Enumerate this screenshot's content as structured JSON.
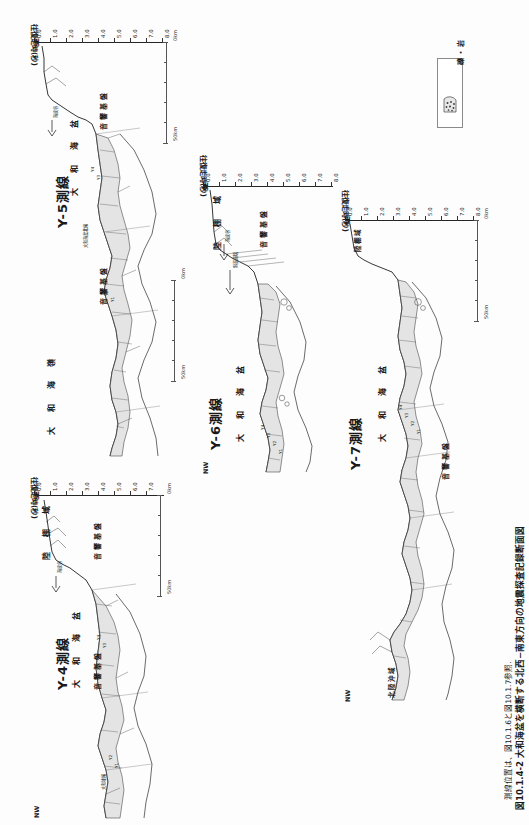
{
  "header": {
    "left": "",
    "right": ""
  },
  "axis": {
    "title": "往復走時(秒)",
    "ticks": [
      "0.0",
      "1.0",
      "2.0",
      "3.0",
      "4.0",
      "5.0",
      "6.0",
      "7.0",
      "8.0"
    ],
    "left_corner": "SE",
    "right_corner": "NW",
    "scale_zero": "0km",
    "scale_fifty": "50km"
  },
  "legend": {
    "label": "礫・岩",
    "pattern_name": "gravel-rock-pattern"
  },
  "caption": {
    "main": "図10.1.4-2  大和海盆を横断する北西−南東方向の地震探査記録断面図",
    "sub": "測線位置は、図10.1.6と図10.1.7参照."
  },
  "panels": [
    {
      "id": "y4",
      "title": "Y-4測線",
      "axis_title": "往復走時(秒)",
      "se_label": "SE",
      "nw_label": "NW",
      "regions": [
        "陸 棚 域",
        "大 和 海 盆"
      ],
      "basement": [
        "音響基盤",
        "音響基盤"
      ],
      "annotations": [
        "海底谷",
        "大和堆縁",
        "Y4",
        "Y3",
        "Y2",
        "Y1"
      ]
    },
    {
      "id": "y5",
      "title": "Y-5測線",
      "axis_title": "往復走時(秒)",
      "se_label": "SE",
      "nw_label": "NW",
      "regions": [
        "陸 棚 域",
        "大 和 海 盆",
        "大 和 海 嶺"
      ],
      "basement": [
        "音響基盤",
        "音響基盤"
      ],
      "annotations": [
        "海底谷",
        "大和海盆北縁",
        "Y4",
        "Y3",
        "Y2",
        "Y1"
      ]
    },
    {
      "id": "y6",
      "title": "Y-6測線",
      "axis_title": "往復走時(秒)",
      "se_label": "SE",
      "nw_label": "NW",
      "regions": [
        "陸 棚 域",
        "大 和 海 盆"
      ],
      "basement": [
        "音響基盤",
        "音響基盤"
      ],
      "annotations": [
        "海底谷",
        "斜面崩壊",
        "Y4",
        "Y3",
        "Y2",
        "Y1"
      ]
    },
    {
      "id": "y7",
      "title": "Y-7測線",
      "axis_title": "往復走時(秒)",
      "se_label": "SE",
      "nw_label": "NW",
      "regions": [
        "陸棚域",
        "大 和 海 盆",
        "北陸沖域"
      ],
      "basement": [
        "音響基盤",
        "音響基盤"
      ],
      "annotations": [
        "Y4",
        "Y3",
        "Y2",
        "Y1"
      ]
    }
  ]
}
